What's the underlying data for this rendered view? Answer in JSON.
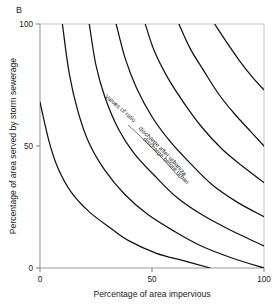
{
  "figure": {
    "panel_label": "B",
    "background": "#ffffff",
    "line_color": "#111111"
  },
  "chart_data": {
    "type": "line",
    "title": "",
    "subtitle": "",
    "panel": "B",
    "xlabel": "Percentage of area impervious",
    "ylabel": "Percentage of area served by storm sewerage",
    "xlim": [
      0,
      100
    ],
    "ylim": [
      0,
      100
    ],
    "xticks": [
      0,
      50,
      100
    ],
    "yticks": [
      0,
      50,
      100
    ],
    "xticklabels": [
      "0",
      "50",
      "100"
    ],
    "yticklabels": [
      "0",
      "50",
      "100"
    ],
    "grid": false,
    "legend": "none",
    "annotations": [
      {
        "id": "ratio-label",
        "text_line1": "Values of ratio",
        "numerator": "discharge after urbanization",
        "denominator": "discharge before urbanization",
        "full_text": "Values of ratio  discharge after urbanization / discharge before urbanization",
        "orientation": "diagonal",
        "has_fraction_bar": true
      }
    ],
    "series": [
      {
        "name": "contour-1",
        "points": [
          [
            0,
            68
          ],
          [
            4,
            52
          ],
          [
            8,
            41
          ],
          [
            14,
            31
          ],
          [
            22,
            23
          ],
          [
            32,
            16
          ],
          [
            40,
            11
          ],
          [
            52,
            6
          ],
          [
            64,
            3
          ],
          [
            76,
            0
          ]
        ]
      },
      {
        "name": "contour-2",
        "points": [
          [
            10,
            100
          ],
          [
            13,
            80
          ],
          [
            17,
            64
          ],
          [
            22,
            51
          ],
          [
            29,
            40
          ],
          [
            38,
            30
          ],
          [
            48,
            22
          ],
          [
            60,
            15
          ],
          [
            72,
            9
          ],
          [
            86,
            4
          ],
          [
            100,
            0
          ]
        ]
      },
      {
        "name": "contour-3",
        "points": [
          [
            22,
            100
          ],
          [
            25,
            83
          ],
          [
            29,
            70
          ],
          [
            35,
            57
          ],
          [
            42,
            47
          ],
          [
            51,
            38
          ],
          [
            61,
            29
          ],
          [
            72,
            22
          ],
          [
            84,
            16
          ],
          [
            100,
            9
          ]
        ]
      },
      {
        "name": "contour-4",
        "points": [
          [
            34,
            100
          ],
          [
            38,
            86
          ],
          [
            43,
            74
          ],
          [
            50,
            62
          ],
          [
            58,
            52
          ],
          [
            67,
            43
          ],
          [
            77,
            34
          ],
          [
            88,
            27
          ],
          [
            100,
            21
          ]
        ]
      },
      {
        "name": "contour-5",
        "points": [
          [
            47,
            100
          ],
          [
            51,
            89
          ],
          [
            57,
            78
          ],
          [
            64,
            68
          ],
          [
            72,
            58
          ],
          [
            81,
            49
          ],
          [
            90,
            42
          ],
          [
            100,
            35
          ]
        ]
      },
      {
        "name": "contour-6",
        "points": [
          [
            62,
            100
          ],
          [
            67,
            90
          ],
          [
            73,
            81
          ],
          [
            80,
            71
          ],
          [
            87,
            63
          ],
          [
            94,
            56
          ],
          [
            100,
            50
          ]
        ]
      },
      {
        "name": "contour-7",
        "points": [
          [
            78,
            100
          ],
          [
            83,
            93
          ],
          [
            89,
            85
          ],
          [
            95,
            78
          ],
          [
            100,
            73
          ]
        ]
      }
    ]
  }
}
